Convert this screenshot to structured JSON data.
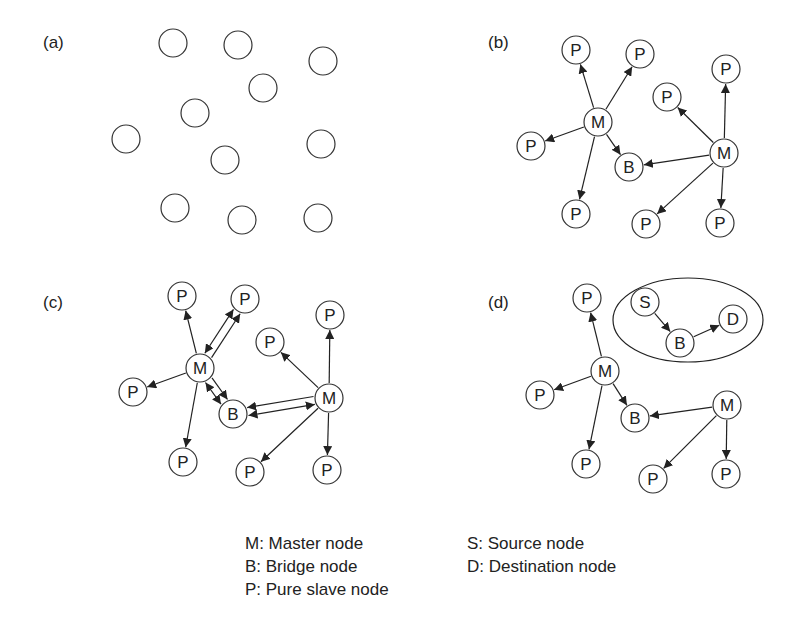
{
  "panels": [
    {
      "label": "(a)",
      "x": 43,
      "y": 48
    },
    {
      "label": "(b)",
      "x": 488,
      "y": 48
    },
    {
      "label": "(c)",
      "x": 43,
      "y": 308
    },
    {
      "label": "(d)",
      "x": 488,
      "y": 308
    }
  ],
  "node_radius": 14,
  "arrow_color": "#222222",
  "plain_nodes": [
    [
      173,
      43
    ],
    [
      238,
      45
    ],
    [
      323,
      61
    ],
    [
      263,
      88
    ],
    [
      195,
      113
    ],
    [
      126,
      139
    ],
    [
      225,
      160
    ],
    [
      321,
      144
    ],
    [
      175,
      208
    ],
    [
      242,
      220
    ],
    [
      318,
      218
    ]
  ],
  "nodes": {
    "b_P1": {
      "x": 576,
      "y": 50,
      "t": "P"
    },
    "b_P2": {
      "x": 640,
      "y": 54,
      "t": "P"
    },
    "b_M1": {
      "x": 598,
      "y": 122,
      "t": "M"
    },
    "b_P3": {
      "x": 531,
      "y": 146,
      "t": "P"
    },
    "b_B": {
      "x": 629,
      "y": 167,
      "t": "B"
    },
    "b_P4": {
      "x": 576,
      "y": 214,
      "t": "P"
    },
    "b_P5": {
      "x": 667,
      "y": 97,
      "t": "P"
    },
    "b_P6": {
      "x": 726,
      "y": 69,
      "t": "P"
    },
    "b_M2": {
      "x": 724,
      "y": 153,
      "t": "M"
    },
    "b_P7": {
      "x": 646,
      "y": 224,
      "t": "P"
    },
    "b_P8": {
      "x": 720,
      "y": 223,
      "t": "P"
    },
    "c_P1": {
      "x": 182,
      "y": 296,
      "t": "P"
    },
    "c_P2": {
      "x": 245,
      "y": 299,
      "t": "P"
    },
    "c_M1": {
      "x": 200,
      "y": 368,
      "t": "M"
    },
    "c_P3": {
      "x": 133,
      "y": 392,
      "t": "P"
    },
    "c_B": {
      "x": 233,
      "y": 414,
      "t": "B"
    },
    "c_P4": {
      "x": 183,
      "y": 462,
      "t": "P"
    },
    "c_P5": {
      "x": 270,
      "y": 342,
      "t": "P"
    },
    "c_P6": {
      "x": 330,
      "y": 315,
      "t": "P"
    },
    "c_M2": {
      "x": 329,
      "y": 398,
      "t": "M"
    },
    "c_P7": {
      "x": 250,
      "y": 472,
      "t": "P"
    },
    "c_P8": {
      "x": 327,
      "y": 470,
      "t": "P"
    },
    "d_P1": {
      "x": 587,
      "y": 298,
      "t": "P"
    },
    "d_S": {
      "x": 645,
      "y": 302,
      "t": "S"
    },
    "d_B2": {
      "x": 680,
      "y": 343,
      "t": "B"
    },
    "d_D": {
      "x": 733,
      "y": 319,
      "t": "D"
    },
    "d_M1": {
      "x": 605,
      "y": 371,
      "t": "M"
    },
    "d_P2": {
      "x": 540,
      "y": 395,
      "t": "P"
    },
    "d_B": {
      "x": 635,
      "y": 418,
      "t": "B"
    },
    "d_M2": {
      "x": 727,
      "y": 405,
      "t": "M"
    },
    "d_P3": {
      "x": 586,
      "y": 464,
      "t": "P"
    },
    "d_P4": {
      "x": 653,
      "y": 479,
      "t": "P"
    },
    "d_P5": {
      "x": 726,
      "y": 474,
      "t": "P"
    }
  },
  "edges": [
    [
      "b_M1",
      "b_P1"
    ],
    [
      "b_M1",
      "b_P2"
    ],
    [
      "b_M1",
      "b_P3"
    ],
    [
      "b_M1",
      "b_B"
    ],
    [
      "b_M1",
      "b_P4"
    ],
    [
      "b_M2",
      "b_P5"
    ],
    [
      "b_M2",
      "b_P6"
    ],
    [
      "b_M2",
      "b_B"
    ],
    [
      "b_M2",
      "b_P7"
    ],
    [
      "b_M2",
      "b_P8"
    ],
    [
      "c_M1",
      "c_P1"
    ],
    [
      "c_M1",
      "c_P3"
    ],
    [
      "c_M1",
      "c_P4"
    ],
    [
      "c_M2",
      "c_P5"
    ],
    [
      "c_M2",
      "c_P6"
    ],
    [
      "c_M2",
      "c_P7"
    ],
    [
      "c_M2",
      "c_P8"
    ]
  ],
  "offset_edges": [
    {
      "from": "c_M1",
      "to": "c_P2",
      "off": 4,
      "double": false
    },
    {
      "from": "c_M1",
      "to": "c_P2",
      "off": -4,
      "double": true
    },
    {
      "from": "c_M1",
      "to": "c_B",
      "off": -4,
      "double": false
    },
    {
      "from": "c_M1",
      "to": "c_B",
      "off": 4,
      "double": true
    },
    {
      "from": "c_M2",
      "to": "c_B",
      "off": 4,
      "double": false
    },
    {
      "from": "c_M2",
      "to": "c_B",
      "off": -4,
      "double": true
    }
  ],
  "d_edges": [
    [
      "d_M1",
      "d_P1"
    ],
    [
      "d_M1",
      "d_P2"
    ],
    [
      "d_M1",
      "d_B"
    ],
    [
      "d_M1",
      "d_P3"
    ],
    [
      "d_M2",
      "d_B"
    ],
    [
      "d_M2",
      "d_P4"
    ],
    [
      "d_M2",
      "d_P5"
    ],
    [
      "d_S",
      "d_B2"
    ],
    [
      "d_B2",
      "d_D"
    ]
  ],
  "ellipse": {
    "cx": 688,
    "cy": 320,
    "rx": 75,
    "ry": 42
  },
  "legend": {
    "left": [
      "M: Master node",
      "B: Bridge node",
      "P: Pure slave node"
    ],
    "right": [
      "S: Source node",
      "D: Destination node"
    ]
  }
}
